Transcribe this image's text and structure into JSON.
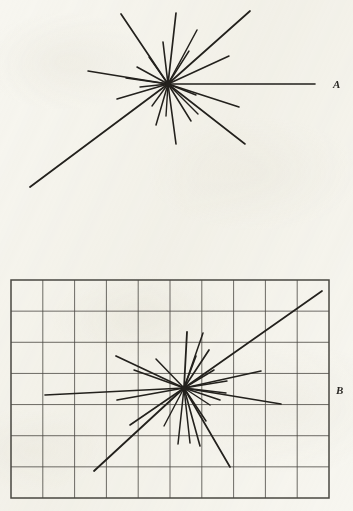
{
  "figure": {
    "kind": "star-plot-pair",
    "background_color": "#f7f6f0",
    "ink_color": "#23211d",
    "grid_color": "#4a4842",
    "width": 353,
    "height": 511
  },
  "panels": [
    {
      "id": "A",
      "label": "A",
      "label_x": 337,
      "label_y": 84,
      "has_grid": false,
      "center_x": 168,
      "center_y": 84,
      "ray_count": 24,
      "rays": [
        {
          "x": 176,
          "y": 13,
          "w": 1.7
        },
        {
          "x": 197,
          "y": 30,
          "w": 1.5
        },
        {
          "x": 250,
          "y": 11,
          "w": 1.7
        },
        {
          "x": 229,
          "y": 56,
          "w": 1.5
        },
        {
          "x": 189,
          "y": 51,
          "w": 1.4
        },
        {
          "x": 163,
          "y": 42,
          "w": 1.6
        },
        {
          "x": 121,
          "y": 14,
          "w": 1.7
        },
        {
          "x": 149,
          "y": 57,
          "w": 1.4
        },
        {
          "x": 137,
          "y": 67,
          "w": 1.5
        },
        {
          "x": 88,
          "y": 71,
          "w": 1.5
        },
        {
          "x": 126,
          "y": 78,
          "w": 1.4
        },
        {
          "x": 140,
          "y": 87,
          "w": 1.4
        },
        {
          "x": 117,
          "y": 99,
          "w": 1.5
        },
        {
          "x": 30,
          "y": 187,
          "w": 1.8
        },
        {
          "x": 152,
          "y": 106,
          "w": 1.4
        },
        {
          "x": 156,
          "y": 125,
          "w": 1.5
        },
        {
          "x": 166,
          "y": 116,
          "w": 1.4
        },
        {
          "x": 176,
          "y": 144,
          "w": 1.6
        },
        {
          "x": 191,
          "y": 121,
          "w": 1.5
        },
        {
          "x": 198,
          "y": 114,
          "w": 1.4
        },
        {
          "x": 245,
          "y": 144,
          "w": 1.6
        },
        {
          "x": 239,
          "y": 107,
          "w": 1.5
        },
        {
          "x": 196,
          "y": 95,
          "w": 1.4
        },
        {
          "x": 315,
          "y": 84,
          "w": 1.6
        }
      ]
    },
    {
      "id": "B",
      "label": "B",
      "label_x": 340,
      "label_y": 390,
      "has_grid": true,
      "grid": {
        "x0": 11,
        "y0": 280,
        "x1": 329,
        "y1": 498,
        "columns": 10,
        "rows": 7
      },
      "center_x": 184,
      "center_y": 388,
      "ray_count": 24,
      "rays": [
        {
          "x": 187,
          "y": 332,
          "w": 1.8
        },
        {
          "x": 196,
          "y": 356,
          "w": 1.6
        },
        {
          "x": 203,
          "y": 333,
          "w": 1.5
        },
        {
          "x": 209,
          "y": 350,
          "w": 1.7
        },
        {
          "x": 322,
          "y": 291,
          "w": 1.7
        },
        {
          "x": 214,
          "y": 370,
          "w": 1.5
        },
        {
          "x": 261,
          "y": 371,
          "w": 1.6
        },
        {
          "x": 227,
          "y": 381,
          "w": 1.4
        },
        {
          "x": 281,
          "y": 404,
          "w": 1.6
        },
        {
          "x": 226,
          "y": 393,
          "w": 1.4
        },
        {
          "x": 220,
          "y": 400,
          "w": 1.5
        },
        {
          "x": 210,
          "y": 405,
          "w": 1.4
        },
        {
          "x": 206,
          "y": 421,
          "w": 1.5
        },
        {
          "x": 230,
          "y": 467,
          "w": 1.7
        },
        {
          "x": 200,
          "y": 446,
          "w": 1.6
        },
        {
          "x": 190,
          "y": 443,
          "w": 1.5
        },
        {
          "x": 178,
          "y": 444,
          "w": 1.5
        },
        {
          "x": 164,
          "y": 426,
          "w": 1.4
        },
        {
          "x": 94,
          "y": 471,
          "w": 1.8
        },
        {
          "x": 130,
          "y": 425,
          "w": 1.6
        },
        {
          "x": 117,
          "y": 400,
          "w": 1.6
        },
        {
          "x": 45,
          "y": 395,
          "w": 1.7
        },
        {
          "x": 134,
          "y": 370,
          "w": 1.5
        },
        {
          "x": 156,
          "y": 359,
          "w": 1.5
        },
        {
          "x": 116,
          "y": 356,
          "w": 1.7
        }
      ]
    }
  ]
}
